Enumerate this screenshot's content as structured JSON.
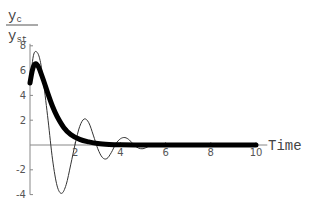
{
  "chart_data": {
    "type": "line",
    "title": "",
    "xlabel": "Time",
    "ylabel": {
      "numerator": "y",
      "numerator_sub": "c",
      "denominator": "y",
      "denominator_sub": "st"
    },
    "xlim": [
      0,
      10.5
    ],
    "ylim": [
      -4,
      8
    ],
    "x_ticks": [
      2,
      4,
      6,
      8,
      10
    ],
    "y_ticks": [
      -4,
      -2,
      2,
      4,
      6,
      8
    ],
    "grid": false,
    "legend": null,
    "series": [
      {
        "name": "thick response",
        "style": "thick-solid",
        "x": [
          0,
          0.1,
          0.2,
          0.3,
          0.4,
          0.6,
          0.8,
          1.0,
          1.2,
          1.5,
          1.8,
          2.2,
          2.6,
          3.0,
          3.5,
          4.0,
          5.0,
          6.0,
          8.0,
          10.0
        ],
        "values": [
          5.0,
          6.0,
          6.5,
          6.5,
          6.2,
          5.2,
          4.1,
          3.1,
          2.3,
          1.4,
          0.85,
          0.45,
          0.25,
          0.12,
          0.05,
          0.02,
          0.0,
          0.0,
          0.0,
          0.0
        ]
      },
      {
        "name": "oscillating response",
        "style": "thin-solid",
        "x": [
          0,
          0.15,
          0.3,
          0.45,
          0.6,
          0.8,
          1.0,
          1.2,
          1.4,
          1.6,
          1.8,
          2.0,
          2.2,
          2.4,
          2.6,
          2.8,
          3.0,
          3.2,
          3.4,
          3.6,
          3.8,
          4.0,
          4.2,
          4.4,
          4.6,
          4.8,
          5.0,
          5.2,
          5.4,
          5.6,
          5.8,
          6.0,
          6.4,
          7.0,
          8.0,
          10.0
        ],
        "values": [
          5.0,
          7.2,
          7.5,
          6.8,
          5.0,
          2.0,
          -1.2,
          -3.3,
          -3.9,
          -3.2,
          -1.6,
          0.1,
          1.5,
          2.1,
          1.8,
          0.8,
          -0.3,
          -1.0,
          -1.1,
          -0.6,
          0.1,
          0.5,
          0.6,
          0.4,
          0.0,
          -0.25,
          -0.3,
          -0.15,
          0.05,
          0.12,
          0.1,
          0.0,
          -0.05,
          0.0,
          0.0,
          0.0
        ]
      },
      {
        "name": "dashed response",
        "style": "thin-dashed",
        "x": [
          0,
          0.2,
          0.4,
          0.6,
          0.8,
          1.0,
          1.3,
          1.6,
          2.0,
          2.5,
          3.0,
          4.0,
          6.0,
          10.0
        ],
        "values": [
          5.0,
          6.4,
          6.3,
          5.4,
          4.3,
          3.3,
          2.2,
          1.4,
          0.75,
          0.35,
          0.15,
          0.03,
          0.0,
          0.0
        ]
      }
    ]
  },
  "plot_area": {
    "origin_px": [
      30,
      145
    ],
    "px_per_x": 22.6,
    "px_per_y": 12.4
  }
}
